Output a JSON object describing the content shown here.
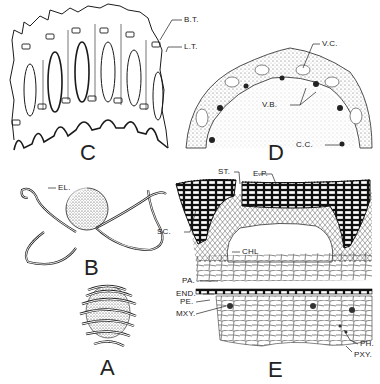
{
  "figure": {
    "panels": [
      {
        "id": "C",
        "label": "C",
        "description": "Longitudinal view of stem tissue showing lacunae and transfusion tissue"
      },
      {
        "id": "D",
        "label": "D",
        "description": "Transverse section of stem"
      },
      {
        "id": "B",
        "label": "B",
        "description": "Spore with elaters extended"
      },
      {
        "id": "A",
        "label": "A",
        "description": "Spore with elaters coiled"
      },
      {
        "id": "E",
        "label": "E",
        "description": "Detailed transverse section of stem ridge"
      }
    ],
    "annotations": {
      "bt": "B.T.",
      "lt": "L.T.",
      "vc": "V.C.",
      "vb": "V.B.",
      "cc": "C.C.",
      "el": "EL.",
      "st": "ST.",
      "ep": "E.P.",
      "sc": "SC.",
      "chl": "CHL",
      "pa": "PA.",
      "end": "END.",
      "pe": "PE.",
      "mxy": "MXY.",
      "ph": "PH.",
      "pxy": "PXY."
    },
    "colors": {
      "ink": "#1a1a1a",
      "paper": "#ffffff",
      "stipple": "#555555"
    }
  }
}
